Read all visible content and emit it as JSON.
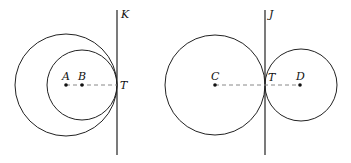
{
  "figures": [
    {
      "tangent_line_label": "K",
      "tangent_point_label": "T",
      "centers": [
        {
          "label": "A",
          "x": 66,
          "y": 85,
          "r": 51
        },
        {
          "label": "B",
          "x": 82,
          "y": 85,
          "r": 35
        }
      ],
      "line_x": 117
    },
    {
      "tangent_line_label": "J",
      "tangent_point_label": "T",
      "centers": [
        {
          "label": "C",
          "x": 215,
          "y": 85,
          "r": 50
        },
        {
          "label": "D",
          "x": 300,
          "y": 85,
          "r": 36
        }
      ],
      "line_x": 265
    }
  ],
  "colors": {
    "stroke": "#222222",
    "dash": "#888888"
  }
}
